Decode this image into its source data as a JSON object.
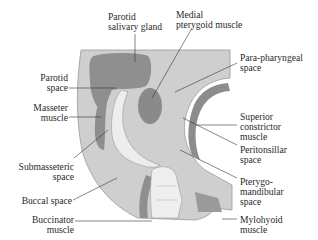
{
  "figure": {
    "labels": {
      "parotid_gland": "Parotid\nsalivary gland",
      "medial_pterygoid": "Medial\npterygoid muscle",
      "parapharyngeal": "Para-pharyngeal\nspace",
      "parotid_space": "Parotid\nspace",
      "masseter": "Masseter\nmuscle",
      "superior_constrictor": "Superior\nconstrictor\nmuscle",
      "peritonsillar": "Peritonsillar\nspace",
      "submasseteric": "Submasseteric\nspace",
      "pterygomandibular": "Pterygo-\nmandibular\nspace",
      "buccal_space": "Buccal space",
      "buccinator": "Buccinator\nmuscle",
      "mylohyoid": "Mylohyoid\nmuscle"
    },
    "colors": {
      "background_tissue": "#c9c9c9",
      "light_tissue": "#d8d8d8",
      "dark_region": "#8e8e8e",
      "muscle_band": "#9a9a9a",
      "bone": "#ececec",
      "leader_line": "#333333",
      "text": "#2a2a2a"
    }
  }
}
